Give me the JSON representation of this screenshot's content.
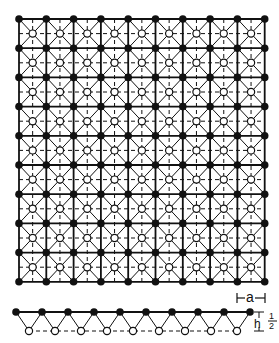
{
  "diagram": {
    "title": "",
    "top_view": {
      "filled_atoms_grid": {
        "cols": 10,
        "rows": 10
      },
      "open_atoms_grid": {
        "cols": 9,
        "rows": 9
      },
      "x0": 19,
      "y0": 19,
      "dx": 27.3,
      "dy": 29.2
    },
    "side_view": {
      "filled_atoms_count": 10,
      "open_atoms_count": 9,
      "top_y": 312,
      "bottom_y": 331,
      "x0": 16,
      "dx": 26
    },
    "labels": {
      "lattice_constant": "a",
      "height_symbol": "h",
      "height_equals": "=",
      "height_numerator": "1",
      "height_denominator": "2"
    },
    "colors": {
      "line": "#111111",
      "filled_atom": "#111111",
      "open_atom_fill": "#ffffff",
      "background": "#ffffff"
    }
  }
}
